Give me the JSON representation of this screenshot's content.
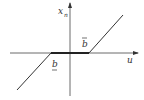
{
  "diagram": {
    "type": "dead-zone nonlinearity",
    "axes": {
      "vertical_label": "x",
      "vertical_subscript": "n",
      "horizontal_label": "u"
    },
    "labels": {
      "upper_threshold": "b",
      "upper_threshold_mark": "overbar",
      "lower_threshold": "b",
      "lower_threshold_mark": "underbar"
    },
    "colors": {
      "line": "#333333",
      "background": "#ffffff"
    }
  }
}
